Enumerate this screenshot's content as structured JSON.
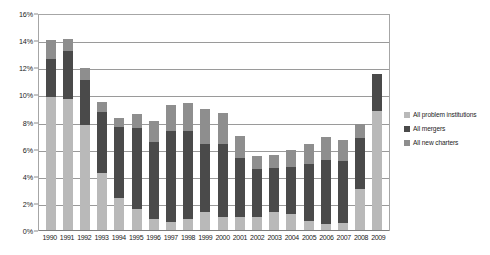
{
  "chart_data": {
    "type": "bar",
    "subtype": "stacked-vertical",
    "title": "",
    "xlabel": "",
    "ylabel": "",
    "ylim": [
      0,
      16
    ],
    "yticks": [
      "0%",
      "2%",
      "4%",
      "6%",
      "8%",
      "10%",
      "12%",
      "14%",
      "16%"
    ],
    "ytick_values": [
      0,
      2,
      4,
      6,
      8,
      10,
      12,
      14,
      16
    ],
    "grid": true,
    "legend_position": "right",
    "categories": [
      "1990",
      "1991",
      "1992",
      "1993",
      "1994",
      "1995",
      "1996",
      "1997",
      "1998",
      "1999",
      "2000",
      "2001",
      "2002",
      "2003",
      "2004",
      "2005",
      "2006",
      "2007",
      "2008",
      "2009"
    ],
    "series": [
      {
        "name": "All new charters",
        "color": "#8e8e8e",
        "values": [
          1.4,
          0.9,
          0.85,
          0.7,
          0.6,
          1.0,
          1.5,
          1.9,
          2.1,
          2.6,
          2.3,
          1.65,
          1.0,
          0.95,
          1.25,
          1.45,
          1.65,
          1.5,
          1.05,
          0.0
        ]
      },
      {
        "name": "All mergers",
        "color": "#4a4a4a",
        "values": [
          2.8,
          3.5,
          3.35,
          4.5,
          5.25,
          6.0,
          5.7,
          6.7,
          6.5,
          5.0,
          5.4,
          4.35,
          3.5,
          3.25,
          3.5,
          4.2,
          4.7,
          4.6,
          3.75,
          2.7
        ]
      },
      {
        "name": "All problem institutions",
        "color": "#b9b9b9",
        "values": [
          9.85,
          9.75,
          7.8,
          4.3,
          2.45,
          1.6,
          0.9,
          0.7,
          0.85,
          1.4,
          1.0,
          1.0,
          1.05,
          1.4,
          1.25,
          0.75,
          0.55,
          0.6,
          3.1,
          8.85
        ]
      }
    ],
    "totals": [
      14.05,
      14.15,
      12.0,
      9.5,
      8.3,
      8.6,
      8.1,
      9.3,
      9.45,
      9.0,
      8.7,
      7.0,
      5.55,
      5.6,
      6.0,
      6.4,
      6.9,
      6.7,
      7.9,
      11.55
    ]
  },
  "legend": {
    "items": [
      {
        "label": "All problem institutions",
        "color": "#b9b9b9"
      },
      {
        "label": "All mergers",
        "color": "#4a4a4a"
      },
      {
        "label": "All new charters",
        "color": "#8e8e8e"
      }
    ]
  }
}
